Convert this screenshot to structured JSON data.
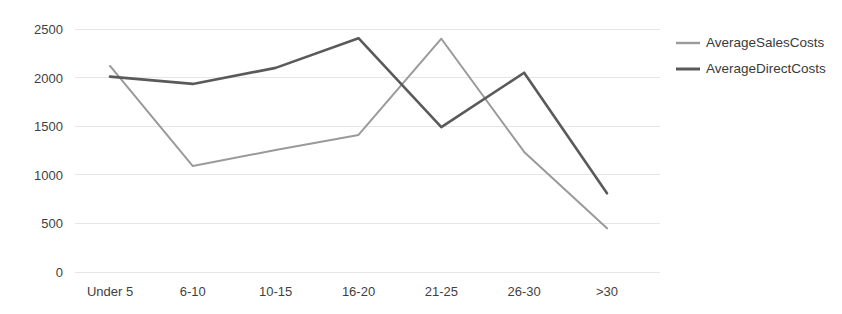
{
  "chart_data": {
    "type": "line",
    "title": "",
    "xlabel": "",
    "ylabel": "",
    "categories": [
      "Under 5",
      "6-10",
      "10-15",
      "16-20",
      "21-25",
      "26-30",
      ">30"
    ],
    "series": [
      {
        "name": "AverageSalesCosts",
        "color": "#9a9a9a",
        "values": [
          2120,
          1090,
          1255,
          1410,
          2400,
          1235,
          450
        ]
      },
      {
        "name": "AverageDirectCosts",
        "color": "#5a5a5a",
        "values": [
          2010,
          1935,
          2100,
          2405,
          1490,
          2050,
          810
        ]
      }
    ],
    "ylim": [
      0,
      2500
    ],
    "yticks": [
      0,
      500,
      1000,
      1500,
      2000,
      2500
    ],
    "ytick_labels": [
      "0",
      "500",
      "1000",
      "1500",
      "2000",
      "2500"
    ],
    "grid": true,
    "grid_color": "#e6e6e6",
    "legend_position": "right",
    "background": "#ffffff"
  },
  "axis": {
    "y_labels": [
      "2500",
      "2000",
      "1500",
      "1000",
      "500",
      "0"
    ],
    "x_labels": [
      "Under 5",
      "6-10",
      "10-15",
      "16-20",
      "21-25",
      "26-30",
      ">30"
    ]
  },
  "legend": {
    "items": [
      {
        "label": "AverageSalesCosts",
        "color": "#9a9a9a"
      },
      {
        "label": "AverageDirectCosts",
        "color": "#5a5a5a"
      }
    ]
  }
}
